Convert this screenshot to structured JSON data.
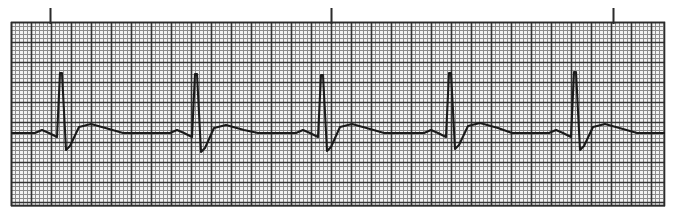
{
  "title": "ECG Rhythm Strip",
  "image": {
    "width": 677,
    "height": 219,
    "background": "#ffffff"
  },
  "grid": {
    "label": "ecg-graph-paper",
    "x": 11,
    "y": 22,
    "width": 654,
    "height": 184,
    "small_box_px": 4.0,
    "large_box_px": 20.0,
    "paper_fill": "#f2f2f2",
    "small_line_color": "#8c8c8c",
    "large_line_color": "#333333",
    "small_line_width": 1,
    "large_line_width": 1.6,
    "border_color": "#2b2b2b",
    "scale_note": "standard 25 mm/s, 10 mm/mV"
  },
  "calibration_ticks": {
    "label": "three-second-interval-markers",
    "color": "#2b2b2b",
    "width": 2,
    "top_y": 8,
    "bottom_y": 24,
    "x_positions": [
      50,
      331,
      613
    ],
    "count": 3
  },
  "trace": {
    "label": "ecg-waveform",
    "color": "#1a1a1a",
    "line_width": 2.1,
    "baseline_y": 133,
    "start_x": 11,
    "end_x": 665,
    "beat_count": 5,
    "r_peak_x": [
      61,
      196,
      322,
      450,
      575
    ],
    "rr_interval_px": [
      135,
      126,
      128,
      125
    ],
    "mean_rr_px": 128.5,
    "r_peak_y": [
      73,
      74,
      75,
      73,
      72
    ],
    "q_dip_y": 137,
    "s_nadir_y": [
      150,
      152,
      151,
      149,
      150
    ],
    "st_plateau_y": [
      124,
      125,
      124,
      123,
      124
    ],
    "t_wave_peak_y": [
      124,
      125,
      124,
      123,
      124
    ],
    "beat_shape_offsets": {
      "p_start_dx": -26,
      "p_peak_dx": -19,
      "p_peak_dy": -3,
      "p_end_dx": -12,
      "q_dx": -4,
      "q_dy": 4,
      "r_up_dx": 0,
      "s_dx": 5,
      "s_dy": 18,
      "j_dx": 9,
      "j_dy": 14,
      "st_rise_dx": 18,
      "st_dy": -9,
      "t_peak_dx": 30,
      "t_dy": -9,
      "t_end_dx": 48,
      "t_end_dy": -4,
      "iso_dx": 62,
      "iso_dy": 0
    }
  },
  "chart_data": {
    "type": "line",
    "title": "ECG Rhythm Strip",
    "xlabel": "",
    "ylabel": "",
    "series": [
      {
        "name": "ECG lead",
        "description": "Five sinus beats with tall narrow R waves, small Q and S deflections, elevated ST segments and broad upright T waves."
      }
    ],
    "beats": [
      {
        "index": 1,
        "r_peak_x": 61,
        "r_peak_y": 73,
        "s_nadir_y": 150,
        "t_peak_y": 124
      },
      {
        "index": 2,
        "r_peak_x": 196,
        "r_peak_y": 74,
        "s_nadir_y": 152,
        "t_peak_y": 125
      },
      {
        "index": 3,
        "r_peak_x": 322,
        "r_peak_y": 75,
        "s_nadir_y": 151,
        "t_peak_y": 124
      },
      {
        "index": 4,
        "r_peak_x": 450,
        "r_peak_y": 73,
        "s_nadir_y": 149,
        "t_peak_y": 123
      },
      {
        "index": 5,
        "r_peak_x": 575,
        "r_peak_y": 72,
        "s_nadir_y": 150,
        "t_peak_y": 124
      }
    ],
    "grid": true,
    "legend": "none",
    "xlim": [
      11,
      665
    ],
    "ylim": [
      206,
      22
    ]
  }
}
